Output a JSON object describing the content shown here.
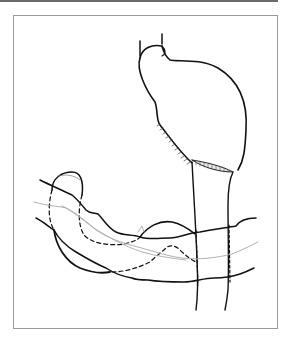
{
  "figure": {
    "caption": "",
    "colors": {
      "line": "#111111",
      "vessel": "#a8a8a8",
      "frame": "#9a9a9a",
      "topbar": "#6a6a6a",
      "background": "#ffffff"
    },
    "parts": [
      {
        "id": "esophagus-stump",
        "label": "esophagus stump"
      },
      {
        "id": "stomach",
        "label": "stomach"
      },
      {
        "id": "hatched-staple-line",
        "label": "hatched resection line"
      },
      {
        "id": "duodenum-tube",
        "label": "duodenum / aorta tube"
      },
      {
        "id": "transverse-colon",
        "label": "transverse colon"
      },
      {
        "id": "cecum-loop",
        "label": "bowel loop"
      },
      {
        "id": "vessel",
        "label": "vessel"
      },
      {
        "id": "dashed-outline",
        "label": "hidden outline (dashed)"
      }
    ]
  }
}
